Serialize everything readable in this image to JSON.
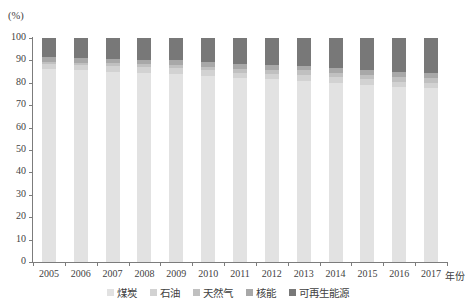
{
  "chart_data": {
    "type": "bar",
    "stacked": true,
    "title": "",
    "subtitle": "",
    "xlabel": "年份",
    "ylabel": "(%)",
    "ylim": [
      0,
      100
    ],
    "yticks": [
      0,
      10,
      20,
      30,
      40,
      50,
      60,
      70,
      80,
      90,
      100
    ],
    "ytick_labels": [
      "0",
      "10",
      "20",
      "30",
      "40",
      "50",
      "60",
      "70",
      "80",
      "90",
      "100"
    ],
    "grid": false,
    "legend_position": "bottom",
    "categories": [
      "2005",
      "2006",
      "2007",
      "2008",
      "2009",
      "2010",
      "2011",
      "2012",
      "2013",
      "2014",
      "2015",
      "2016",
      "2017"
    ],
    "series": [
      {
        "name": "煤炭",
        "color": "#e2e2e2",
        "values": [
          86.0,
          85.5,
          85.0,
          84.5,
          84.0,
          83.0,
          82.0,
          81.5,
          81.0,
          80.0,
          79.0,
          78.0,
          77.5
        ]
      },
      {
        "name": "石油",
        "color": "#d2d2d2",
        "values": [
          2.5,
          2.5,
          2.5,
          2.5,
          2.5,
          2.5,
          2.5,
          2.5,
          2.5,
          2.5,
          2.5,
          2.5,
          2.5
        ]
      },
      {
        "name": "天然气",
        "color": "#c0c0c0",
        "values": [
          1.0,
          1.0,
          1.2,
          1.3,
          1.5,
          1.6,
          1.8,
          1.8,
          2.0,
          2.0,
          2.2,
          2.2,
          2.2
        ]
      },
      {
        "name": "核能",
        "color": "#a8a8a8",
        "values": [
          2.0,
          2.0,
          2.0,
          2.0,
          2.0,
          2.0,
          2.0,
          2.0,
          2.0,
          2.0,
          2.0,
          2.0,
          2.0
        ]
      },
      {
        "name": "可再生能源",
        "color": "#787878",
        "values": [
          8.5,
          9.0,
          9.3,
          9.7,
          10.0,
          10.9,
          11.7,
          12.2,
          12.5,
          13.5,
          14.3,
          15.3,
          15.8
        ]
      }
    ]
  },
  "legend": {
    "items": [
      {
        "label": "煤炭",
        "color": "#e2e2e2"
      },
      {
        "label": "石油",
        "color": "#d2d2d2"
      },
      {
        "label": "天然气",
        "color": "#c0c0c0"
      },
      {
        "label": "核能",
        "color": "#a8a8a8"
      },
      {
        "label": "可再生能源",
        "color": "#787878"
      }
    ]
  }
}
